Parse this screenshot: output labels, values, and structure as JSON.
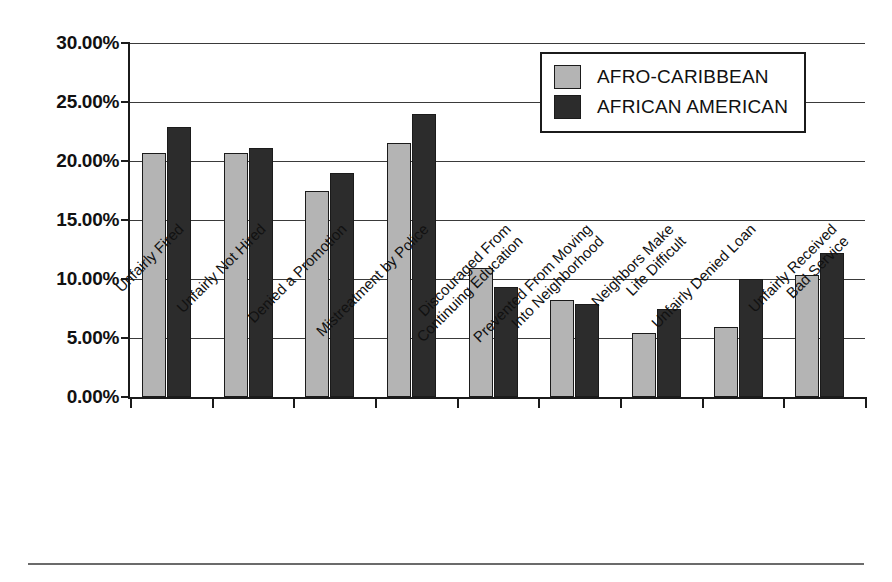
{
  "figure": {
    "bottom_rule": true,
    "top_caption": ""
  },
  "legend": {
    "position": "top-right-inside",
    "entries": [
      {
        "label": "AFRO-CARIBBEAN",
        "color": "#b4b4b4"
      },
      {
        "label": "AFRICAN AMERICAN",
        "color": "#2c2c2c"
      }
    ]
  },
  "chart_data": {
    "type": "bar",
    "title": "",
    "xlabel": "",
    "ylabel": "",
    "ylim": [
      0,
      30
    ],
    "ytick_values": [
      0,
      5,
      10,
      15,
      20,
      25,
      30
    ],
    "ytick_labels": [
      "0.00%",
      "5.00%",
      "10.00%",
      "15.00%",
      "20.00%",
      "25.00%",
      "30.00%"
    ],
    "grid": true,
    "grid_axis": "y",
    "legend_position": "upper right",
    "categories": [
      "Unfairly Fired",
      "Unfairly Not Hired",
      "Denied a Promotion",
      "Mistreatment by Police",
      "Discouraged From Continuing Education",
      "Prevented From Moving Into Neighborhood",
      "Neighbors Make Life Difficult",
      "Unfairly Denied Loan",
      "Unfairly Received Bad Service"
    ],
    "category_lines": [
      [
        "Unfairly Fired"
      ],
      [
        "Unfairly Not Hired"
      ],
      [
        "Denied a Promotion"
      ],
      [
        "Mistreatment by Police"
      ],
      [
        "Discouraged From",
        "Continuing Education"
      ],
      [
        "Prevented From Moving",
        "Into Neighborhood"
      ],
      [
        "Neighbors Make",
        "Life Difficult"
      ],
      [
        "Unfairly Denied Loan"
      ],
      [
        "Unfairly Received",
        "Bad Service"
      ]
    ],
    "series": [
      {
        "name": "AFRO-CARIBBEAN",
        "color": "#b4b4b4",
        "values": [
          20.7,
          20.7,
          17.5,
          21.5,
          10.9,
          8.2,
          5.4,
          5.9,
          10.3
        ]
      },
      {
        "name": "AFRICAN AMERICAN",
        "color": "#2c2c2c",
        "values": [
          22.9,
          21.1,
          19.0,
          24.0,
          9.3,
          7.9,
          7.5,
          10.0,
          12.2
        ]
      }
    ]
  }
}
